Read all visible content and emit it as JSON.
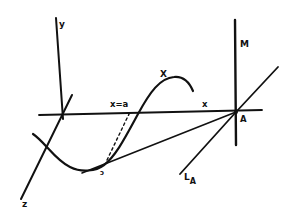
{
  "diagram": {
    "labels": {
      "y_axis": "y",
      "z_axis": "z",
      "x_axis": "x",
      "x_eq_a": "x=a",
      "curve": "X",
      "vertical_line": "M",
      "point": "A",
      "line_main": "L",
      "line_sub": "A",
      "curve_point": "ɔ"
    },
    "colors": {
      "ink": "#111111",
      "background": "#ffffff"
    }
  }
}
